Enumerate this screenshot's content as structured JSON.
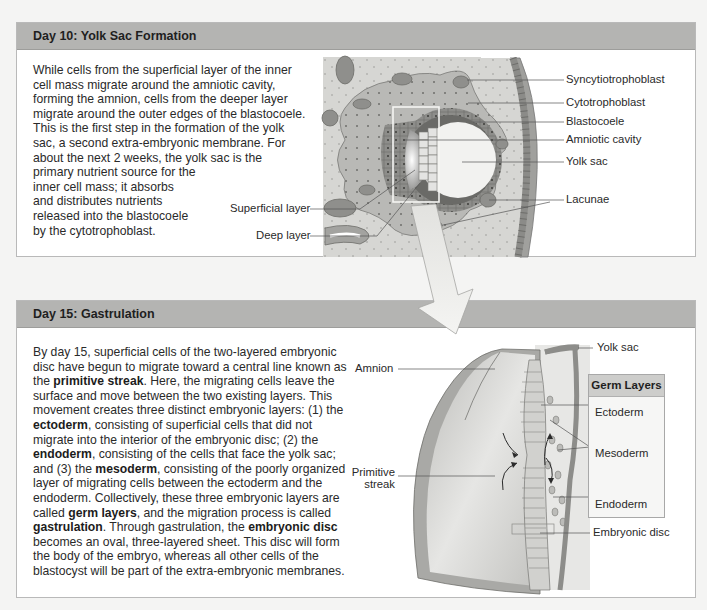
{
  "panel_day10": {
    "title": "Day 10: Yolk Sac Formation",
    "paragraph": [
      "While cells from the superficial layer of the inner",
      "cell mass migrate around the amniotic cavity,",
      "forming the amnion, cells from the deeper layer",
      "migrate around the outer edges of the blastocoele.",
      "This is the first step in the formation of the yolk",
      "sac, a second extra-embryonic membrane. For",
      "about the next 2 weeks, the yolk sac is the",
      "primary nutrient source for the",
      "inner cell mass; it absorbs",
      "and distributes nutrients",
      "released into the blastocoele",
      "by the cytotrophoblast."
    ],
    "labels": {
      "syncytiotrophoblast": "Syncytiotrophoblast",
      "cytotrophoblast": "Cytotrophoblast",
      "blastocoele": "Blastocoele",
      "amniotic_cavity": "Amniotic cavity",
      "yolk_sac": "Yolk sac",
      "lacunae": "Lacunae",
      "superficial_layer": "Superficial layer",
      "deep_layer": "Deep layer"
    }
  },
  "panel_day15": {
    "title": "Day 15: Gastrulation",
    "paragraph_segments": [
      {
        "t": "By day 15, superficial cells of the two-layered embryonic disc have begun to migrate toward a central line known as the ",
        "b": false
      },
      {
        "t": "primitive streak",
        "b": true
      },
      {
        "t": ". Here, the migrating cells leave the surface and move between the two existing layers. This movement creates three distinct embryonic layers: (1) the ",
        "b": false
      },
      {
        "t": "ectoderm",
        "b": true
      },
      {
        "t": ", consisting of superficial cells that did not migrate into the interior of the embryonic disc; (2) the ",
        "b": false
      },
      {
        "t": "endoderm",
        "b": true
      },
      {
        "t": ", consisting of the cells that face the yolk sac; and (3) the ",
        "b": false
      },
      {
        "t": "mesoderm",
        "b": true
      },
      {
        "t": ", consisting of the poorly organized layer of migrating cells between the ectoderm and the endoderm. Collectively, these three embryonic layers are called ",
        "b": false
      },
      {
        "t": "germ layers",
        "b": true
      },
      {
        "t": ", and the migration process is called ",
        "b": false
      },
      {
        "t": "gastrulation",
        "b": true
      },
      {
        "t": ". Through gastrulation, the ",
        "b": false
      },
      {
        "t": "embryonic disc",
        "b": true
      },
      {
        "t": " becomes an oval, three-layered sheet. This disc will form the body of the embryo, whereas all other cells of the blastocyst will be part of the extra-embryonic membranes.",
        "b": false
      }
    ],
    "labels": {
      "yolk_sac": "Yolk sac",
      "amnion": "Amnion",
      "primitive_streak_1": "Primitive",
      "primitive_streak_2": "streak",
      "embryonic_disc": "Embryonic disc"
    },
    "germ_layers": {
      "title": "Germ Layers",
      "ectoderm": "Ectoderm",
      "mesoderm": "Mesoderm",
      "endoderm": "Endoderm"
    }
  },
  "colors": {
    "header_bg": "#b4b4b2",
    "panel_bg": "#ffffff",
    "tissue_light": "#d3d3d0",
    "tissue_mid": "#a9a9a6",
    "tissue_dark": "#7d7d7a"
  }
}
